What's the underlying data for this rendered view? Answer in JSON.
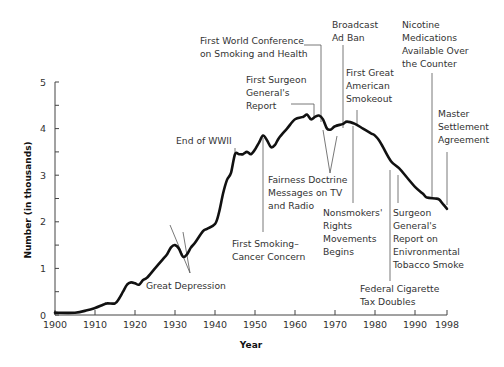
{
  "chart_data": {
    "type": "line",
    "title": "",
    "xlabel": "Year",
    "ylabel": "Number (in thousands)",
    "xlim": [
      1900,
      1998
    ],
    "ylim": [
      0,
      5
    ],
    "x_ticks": [
      1900,
      1910,
      1920,
      1930,
      1940,
      1950,
      1960,
      1970,
      1980,
      1990,
      1998
    ],
    "y_ticks": [
      0,
      1,
      2,
      3,
      4,
      5
    ],
    "grid": false,
    "series": [
      {
        "name": "Number (in thousands)",
        "x": [
          1900,
          1905,
          1908,
          1910,
          1912,
          1913,
          1915,
          1916,
          1917,
          1918,
          1919,
          1920,
          1921,
          1922,
          1923,
          1925,
          1927,
          1928,
          1929,
          1930,
          1931,
          1932,
          1933,
          1934,
          1935,
          1937,
          1938,
          1940,
          1941,
          1942,
          1943,
          1944,
          1945,
          1946,
          1947,
          1948,
          1949,
          1950,
          1951,
          1952,
          1953,
          1954,
          1955,
          1956,
          1958,
          1960,
          1962,
          1963,
          1964,
          1965,
          1966,
          1967,
          1968,
          1969,
          1970,
          1972,
          1973,
          1975,
          1977,
          1979,
          1980,
          1981,
          1982,
          1984,
          1986,
          1988,
          1990,
          1992,
          1993,
          1995,
          1996,
          1997,
          1998
        ],
        "values": [
          0.05,
          0.05,
          0.1,
          0.15,
          0.22,
          0.25,
          0.25,
          0.35,
          0.5,
          0.65,
          0.7,
          0.68,
          0.65,
          0.75,
          0.8,
          1.0,
          1.2,
          1.3,
          1.45,
          1.5,
          1.42,
          1.25,
          1.3,
          1.45,
          1.55,
          1.8,
          1.85,
          1.95,
          2.2,
          2.6,
          2.9,
          3.05,
          3.45,
          3.45,
          3.45,
          3.5,
          3.45,
          3.55,
          3.7,
          3.85,
          3.75,
          3.6,
          3.65,
          3.8,
          4.0,
          4.2,
          4.25,
          4.3,
          4.2,
          4.25,
          4.28,
          4.2,
          4.0,
          3.98,
          4.05,
          4.1,
          4.15,
          4.1,
          4.0,
          3.9,
          3.85,
          3.75,
          3.6,
          3.3,
          3.15,
          2.95,
          2.75,
          2.6,
          2.52,
          2.5,
          2.48,
          2.38,
          2.28
        ]
      }
    ],
    "annotations": [
      {
        "text": [
          "Great Depression"
        ],
        "year": [
          1929,
          1932
        ]
      },
      {
        "text": [
          "End of WWII"
        ],
        "year": 1945
      },
      {
        "text": [
          "First Smoking–",
          "Cancer Concern"
        ],
        "year": 1952
      },
      {
        "text": [
          "First Surgeon",
          "General's",
          "Report"
        ],
        "year": 1964
      },
      {
        "text": [
          "First World Conference",
          "on Smoking and Health"
        ],
        "year": 1967
      },
      {
        "text": [
          "Fairness Doctrine",
          "Messages on TV",
          "and Radio"
        ],
        "year": [
          1967,
          1970
        ]
      },
      {
        "text": [
          "Broadcast",
          "Ad Ban"
        ],
        "year": 1971
      },
      {
        "text": [
          "First Great",
          "American",
          "Smokeout"
        ],
        "year": 1976
      },
      {
        "text": [
          "Nonsmokers'",
          "Rights",
          "Movements",
          "Begins"
        ],
        "year": 1974
      },
      {
        "text": [
          "Federal Cigarette",
          "Tax Doubles"
        ],
        "year": 1983
      },
      {
        "text": [
          "Surgeon",
          "General's",
          "Report on",
          "Enivronmental",
          "Tobacco Smoke"
        ],
        "year": 1986
      },
      {
        "text": [
          "Nicotine",
          "Medications",
          "Available Over",
          "the Counter"
        ],
        "year": 1996
      },
      {
        "text": [
          "Master",
          "Settlement",
          "Agreement"
        ],
        "year": 1998
      }
    ]
  }
}
